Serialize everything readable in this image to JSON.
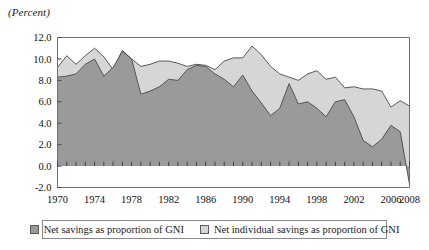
{
  "chart_data": {
    "type": "area",
    "title": "",
    "subtitle": "",
    "unit_label": "(Percent)",
    "xlabel": "",
    "ylabel": "",
    "stacked": false,
    "grid": false,
    "legend_position": "bottom",
    "xlim": [
      1970,
      2008
    ],
    "ylim": [
      -2.0,
      12.0
    ],
    "ytick_labels": [
      "12.0",
      "10.0",
      "8.0",
      "6.0",
      "4.0",
      "2.0",
      "0.0",
      "-2.0"
    ],
    "ytick_values": [
      12.0,
      10.0,
      8.0,
      6.0,
      4.0,
      2.0,
      0.0,
      -2.0
    ],
    "xtick_labels": [
      "1970",
      "1974",
      "1978",
      "1982",
      "1986",
      "1990",
      "1994",
      "1998",
      "2002",
      "2006",
      "2008"
    ],
    "xtick_values": [
      1970,
      1974,
      1978,
      1982,
      1986,
      1990,
      1994,
      1998,
      2002,
      2006,
      2008
    ],
    "x": [
      1970,
      1971,
      1972,
      1973,
      1974,
      1975,
      1976,
      1977,
      1978,
      1979,
      1980,
      1981,
      1982,
      1983,
      1984,
      1985,
      1986,
      1987,
      1988,
      1989,
      1990,
      1991,
      1992,
      1993,
      1994,
      1995,
      1996,
      1997,
      1998,
      1999,
      2000,
      2001,
      2002,
      2003,
      2004,
      2005,
      2006,
      2007,
      2008
    ],
    "series": [
      {
        "name": "Net savings as proportion of GNI",
        "color": "#9a9a9a",
        "line_color": "#4a4a4a",
        "values": [
          8.3,
          8.4,
          8.6,
          9.5,
          10.0,
          8.4,
          9.2,
          10.7,
          10.0,
          6.7,
          7.0,
          7.4,
          8.1,
          8.0,
          9.0,
          9.4,
          9.3,
          8.6,
          8.1,
          7.4,
          8.5,
          7.0,
          5.9,
          4.7,
          5.4,
          7.7,
          5.8,
          6.0,
          5.4,
          4.6,
          6.0,
          6.2,
          4.6,
          2.4,
          1.8,
          2.5,
          3.8,
          3.2,
          -1.7
        ]
      },
      {
        "name": "Net individual savings as proportion of GNI",
        "color": "#d6d6d6",
        "line_color": "#4a4a4a",
        "values": [
          9.2,
          10.3,
          9.5,
          10.3,
          11.0,
          10.2,
          9.0,
          10.8,
          10.0,
          9.3,
          9.5,
          9.8,
          9.8,
          9.6,
          9.3,
          9.5,
          9.4,
          9.0,
          9.8,
          10.1,
          10.1,
          11.2,
          10.4,
          9.3,
          8.6,
          8.3,
          8.0,
          8.6,
          8.9,
          8.1,
          8.3,
          7.3,
          7.4,
          7.2,
          7.2,
          7.0,
          5.5,
          6.1,
          5.6
        ]
      }
    ]
  },
  "legend": {
    "entries": [
      {
        "label": "Net savings as proportion of GNI",
        "swatch_color": "#9a9a9a"
      },
      {
        "label": "Net individual savings as proportion of GNI",
        "swatch_color": "#d6d6d6"
      }
    ]
  }
}
